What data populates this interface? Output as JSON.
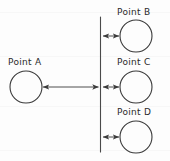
{
  "diagram": {
    "background_color": "#fdfdfd",
    "stroke_color": "#3a3a3a",
    "labels": {
      "point_a": "Point A",
      "point_b": "Point B",
      "point_c": "Point C",
      "point_d": "Point D"
    },
    "nodes": [
      {
        "id": "A",
        "label": "Point A",
        "cx": 26,
        "cy": 87,
        "r": 16
      },
      {
        "id": "B",
        "label": "Point B",
        "cx": 136,
        "cy": 36,
        "r": 16
      },
      {
        "id": "C",
        "label": "Point C",
        "cx": 136,
        "cy": 87,
        "r": 16
      },
      {
        "id": "D",
        "label": "Point D",
        "cx": 136,
        "cy": 137,
        "r": 16
      }
    ],
    "reference_line": {
      "name": "vertical-reference-line",
      "x": 100,
      "y_top": 17,
      "y_bottom": 152
    },
    "arrows": [
      {
        "id": "arrow-a-to-line",
        "x1": 42,
        "x2": 100,
        "y": 87,
        "heads": "both"
      },
      {
        "id": "arrow-line-to-b",
        "x1": 101,
        "x2": 120,
        "y": 36,
        "heads": "both"
      },
      {
        "id": "arrow-line-to-c",
        "x1": 101,
        "x2": 120,
        "y": 87,
        "heads": "both"
      },
      {
        "id": "arrow-line-to-d",
        "x1": 101,
        "x2": 120,
        "y": 137,
        "heads": "both"
      }
    ]
  }
}
